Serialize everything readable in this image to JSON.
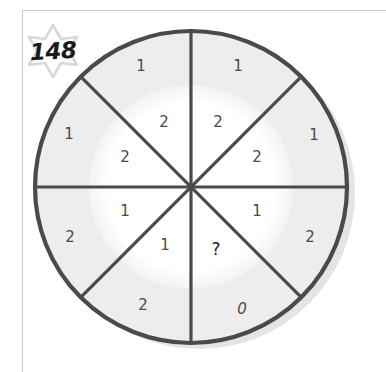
{
  "badge": {
    "icon": "six-point-star-icon",
    "number": "148",
    "star_color": "#d8d8d8"
  },
  "colors": {
    "ring_fill": "#ededed",
    "core_fill": "#ffffff",
    "stroke": "#4a4a4a",
    "text": "#4a4a4a",
    "frame_border": "#c8c8c8",
    "shadow": "#e2e2e2"
  },
  "wheel": {
    "center_x": 191,
    "center_y": 187,
    "outer_radius": 157,
    "inner_radius": 102,
    "sector_count": 8,
    "sectors": [
      {
        "index": 0,
        "start_deg": -90,
        "end_deg": -45,
        "position": "top-right",
        "inner_value": "2",
        "outer_value": "1",
        "inner_x": 218,
        "inner_y": 122,
        "outer_x": 238,
        "outer_y": 66
      },
      {
        "index": 1,
        "start_deg": -45,
        "end_deg": 0,
        "position": "right-upper",
        "inner_value": "2",
        "outer_value": "1",
        "inner_x": 257,
        "inner_y": 157,
        "outer_x": 314,
        "outer_y": 135
      },
      {
        "index": 2,
        "start_deg": 0,
        "end_deg": 45,
        "position": "right-lower",
        "inner_value": "1",
        "outer_value": "2",
        "inner_x": 257,
        "inner_y": 211,
        "outer_x": 310,
        "outer_y": 237
      },
      {
        "index": 3,
        "start_deg": 45,
        "end_deg": 90,
        "position": "bottom-right",
        "inner_value": "?",
        "outer_value": "0",
        "inner_x": 216,
        "inner_y": 249,
        "outer_x": 242,
        "outer_y": 309
      },
      {
        "index": 4,
        "start_deg": 90,
        "end_deg": 135,
        "position": "bottom-left",
        "inner_value": "1",
        "outer_value": "2",
        "inner_x": 165,
        "inner_y": 245,
        "outer_x": 143,
        "outer_y": 305
      },
      {
        "index": 5,
        "start_deg": 135,
        "end_deg": 180,
        "position": "left-lower",
        "inner_value": "1",
        "outer_value": "2",
        "inner_x": 125,
        "inner_y": 211,
        "outer_x": 70,
        "outer_y": 237
      },
      {
        "index": 6,
        "start_deg": 180,
        "end_deg": 225,
        "position": "left-upper",
        "inner_value": "2",
        "outer_value": "1",
        "inner_x": 125,
        "inner_y": 157,
        "outer_x": 69,
        "outer_y": 134
      },
      {
        "index": 7,
        "start_deg": 225,
        "end_deg": 270,
        "position": "top-left",
        "inner_value": "2",
        "outer_value": "1",
        "inner_x": 164,
        "inner_y": 122,
        "outer_x": 141,
        "outer_y": 66
      }
    ]
  }
}
